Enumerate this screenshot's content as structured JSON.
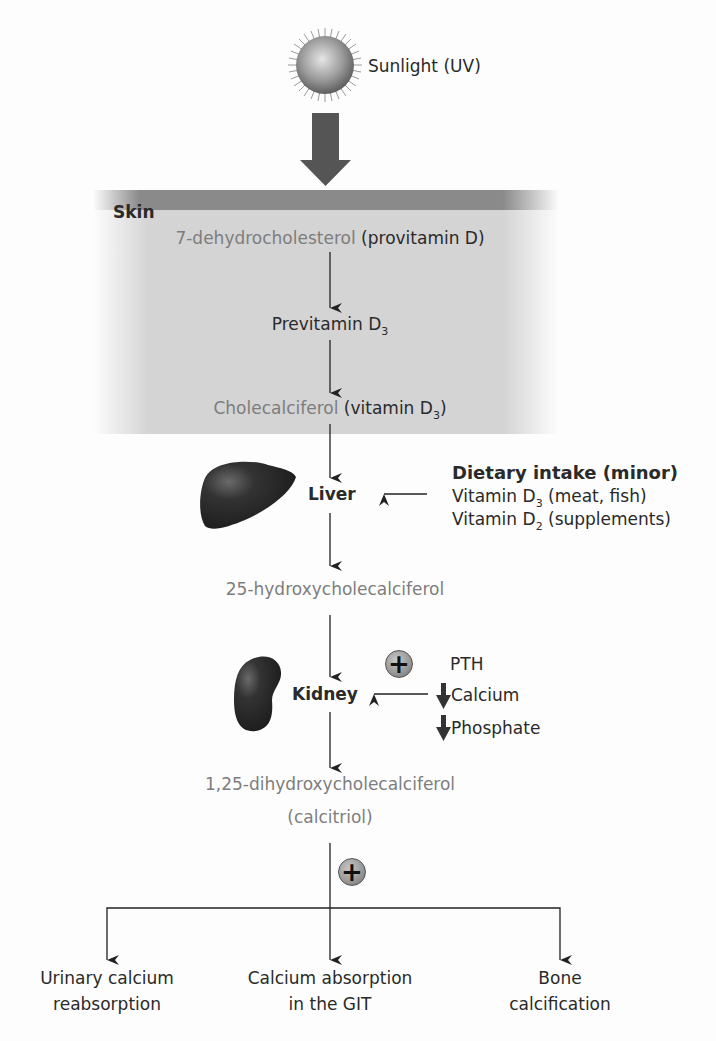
{
  "sun": {
    "label": "Sunlight (UV)"
  },
  "skin": {
    "label": "Skin",
    "step1_grey": "7-dehydrocholesterol",
    "step1_dark": " (provitamin D)",
    "step2": "Previtamin D",
    "step2_sub": "3",
    "step3_grey": "Cholecalciferol",
    "step3_dark": " (vitamin D",
    "step3_sub": "3",
    "step3_close": ")"
  },
  "liver": {
    "label": "Liver",
    "dietary_title": "Dietary intake (minor)",
    "dietary_items": [
      {
        "prefix": "Vitamin D",
        "sub": "3",
        "suffix": " (meat, fish)"
      },
      {
        "prefix": "Vitamin D",
        "sub": "2",
        "suffix": " (supplements)"
      }
    ]
  },
  "intermediate": {
    "label": "25-hydroxycholecalciferol"
  },
  "kidney": {
    "label": "Kidney",
    "stimulus_symbol": "+",
    "regulators": [
      {
        "label": "PTH",
        "arrow": ""
      },
      {
        "label": "Calcium",
        "arrow": "down"
      },
      {
        "label": "Phosphate",
        "arrow": "down"
      }
    ]
  },
  "active": {
    "line1": "1,25-dihydroxycholecalciferol",
    "line2": "(calcitriol)",
    "stimulus_symbol": "+"
  },
  "effects": [
    {
      "line1": "Urinary calcium",
      "line2": "reabsorption"
    },
    {
      "line1": "Calcium absorption",
      "line2": "in the GIT"
    },
    {
      "line1": "Bone",
      "line2": "calcification"
    }
  ],
  "colors": {
    "text_dark": "#2a2a2a",
    "text_grey": "#7d7d7d",
    "arrow": "#222222",
    "skin_bar": "#8a8a8a",
    "skin_area": "#d4d4d4",
    "big_arrow": "#555555"
  }
}
